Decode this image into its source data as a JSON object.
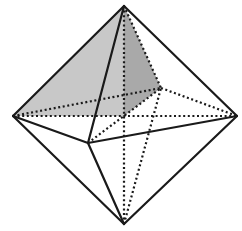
{
  "figure": {
    "width": 242,
    "height": 231,
    "colors": {
      "background": "#ffffff",
      "edge": "#1a1a1a",
      "shade_light": "#c8c8c8",
      "shade_dark": "#a9a9a9"
    },
    "vertices": {
      "top": [
        124,
        6
      ],
      "bottom": [
        124,
        224
      ],
      "left": [
        13,
        116
      ],
      "right": [
        237,
        116
      ],
      "front": [
        88,
        143
      ],
      "back": [
        161,
        88
      ],
      "center": [
        124,
        116
      ]
    },
    "solid_edges": [
      [
        "top",
        "left"
      ],
      [
        "top",
        "right"
      ],
      [
        "top",
        "front"
      ],
      [
        "bottom",
        "left"
      ],
      [
        "bottom",
        "right"
      ],
      [
        "bottom",
        "front"
      ],
      [
        "left",
        "front"
      ],
      [
        "front",
        "right"
      ]
    ],
    "dashed_edges": [
      [
        "top",
        "back"
      ],
      [
        "bottom",
        "back"
      ],
      [
        "left",
        "back"
      ],
      [
        "back",
        "right"
      ],
      [
        "left",
        "right"
      ],
      [
        "front",
        "back"
      ],
      [
        "top",
        "bottom"
      ]
    ],
    "shaded_faces": [
      {
        "name": "face-top-left-center",
        "points": [
          "top",
          "left",
          "center"
        ],
        "color": "shade_light"
      },
      {
        "name": "face-top-left-back",
        "points": [
          "top",
          "left",
          "back"
        ],
        "color": "shade_light"
      },
      {
        "name": "face-top-center-back",
        "points": [
          "top",
          "center",
          "back"
        ],
        "color": "shade_dark"
      }
    ]
  }
}
